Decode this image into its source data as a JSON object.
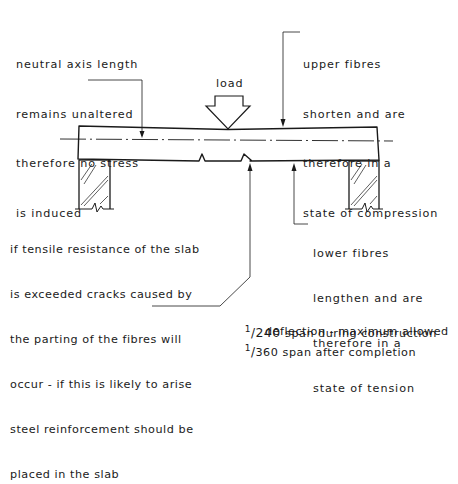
{
  "diagram": {
    "load_label": "load",
    "annotations": {
      "neutral_axis": {
        "lines": [
          "neutral axis length",
          "remains unaltered",
          "therefore no stress",
          "is induced"
        ]
      },
      "upper_fibres": {
        "lines": [
          "upper fibres",
          "shorten and are",
          "therefore in a",
          "state of compression"
        ]
      },
      "tensile_cracks": {
        "lines": [
          "if tensile resistance of the slab",
          "is exceeded cracks caused by",
          "the parting of the fibres will",
          "occur - if this is likely to arise",
          "steel reinforcement should be",
          "placed in the slab"
        ]
      },
      "lower_fibres": {
        "lines": [
          "lower fibres",
          "lengthen and are",
          "therefore in a",
          "state of tension"
        ]
      },
      "deflection": {
        "heading": "deflection - maximum allowed",
        "rules": [
          {
            "fraction_numerator": "1",
            "fraction_denominator": "240",
            "text": "span during construction"
          },
          {
            "fraction_numerator": "1",
            "fraction_denominator": "360",
            "text": "span after completion"
          }
        ]
      }
    },
    "colors": {
      "ink": "#1a1a1a",
      "background": "#ffffff"
    }
  }
}
